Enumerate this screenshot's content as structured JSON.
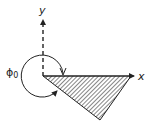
{
  "diagram": {
    "x_axis_label": "x",
    "y_axis_label": "y",
    "angle_label": "ϕ",
    "angle_subscript": "0",
    "colors": {
      "stroke": "#222222",
      "hatch": "#333333",
      "background": "#ffffff"
    }
  }
}
